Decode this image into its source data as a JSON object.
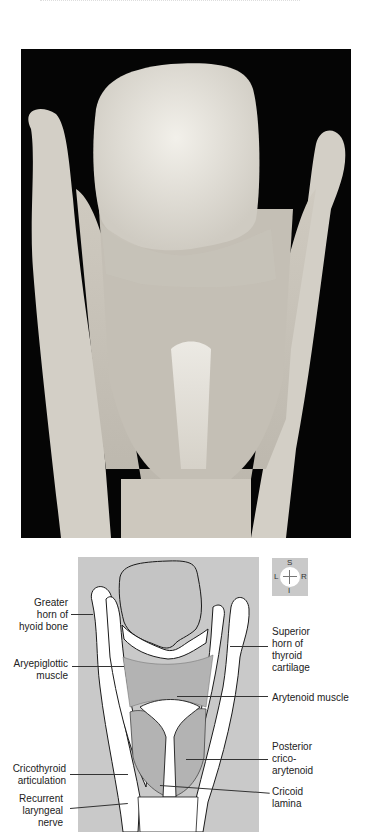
{
  "figure": {
    "photo": {
      "description": "Posterior view of dissected larynx specimen on black background",
      "background_color": "#050505",
      "tissue_color": "#d8d4cc"
    },
    "diagram": {
      "background_color": "#c9c9c9",
      "muscle_color": "#b3b3b3",
      "cartilage_color": "#ffffff",
      "outline_color": "#1a1a1a"
    },
    "compass": {
      "superior": "S",
      "inferior": "I",
      "left": "L",
      "right": "R"
    },
    "labels_left": [
      {
        "text_lines": [
          "Greater",
          "horn of",
          "hyoid bone"
        ],
        "text": "Greater horn of hyoid bone"
      },
      {
        "text_lines": [
          "Aryepiglottic",
          "muscle"
        ],
        "text": "Aryepiglottic muscle"
      },
      {
        "text_lines": [
          "Cricothyroid",
          "articulation"
        ],
        "text": "Cricothyroid articulation"
      },
      {
        "text_lines": [
          "Recurrent",
          "laryngeal",
          "nerve"
        ],
        "text": "Recurrent laryngeal nerve"
      }
    ],
    "labels_right": [
      {
        "text_lines": [
          "Superior",
          "horn of",
          "thyroid",
          "cartilage"
        ],
        "text": "Superior horn of thyroid cartilage"
      },
      {
        "text_lines": [
          "Arytenoid muscle"
        ],
        "text": "Arytenoid muscle"
      },
      {
        "text_lines": [
          "Posterior",
          "crico-",
          "arytenoid"
        ],
        "text": "Posterior crico-arytenoid"
      },
      {
        "text_lines": [
          "Cricoid",
          "lamina"
        ],
        "text": "Cricoid lamina"
      }
    ]
  }
}
